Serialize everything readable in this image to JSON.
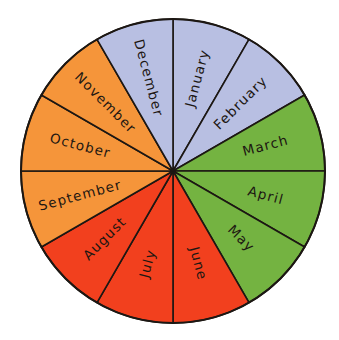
{
  "diagram": {
    "center": [
      173,
      171
    ],
    "radius": 152,
    "label_radius": 96,
    "seasons": {
      "winter": {
        "color": "#b8bfe2"
      },
      "spring": {
        "color": "#74b341"
      },
      "summer": {
        "color": "#f2401e"
      },
      "autumn": {
        "color": "#f5953a"
      }
    },
    "months": [
      {
        "label": "January",
        "season": "winter",
        "start_deg": 0,
        "end_deg": 30
      },
      {
        "label": "February",
        "season": "winter",
        "start_deg": 30,
        "end_deg": 60
      },
      {
        "label": "March",
        "season": "spring",
        "start_deg": 60,
        "end_deg": 90
      },
      {
        "label": "April",
        "season": "spring",
        "start_deg": 90,
        "end_deg": 120
      },
      {
        "label": "May",
        "season": "spring",
        "start_deg": 120,
        "end_deg": 150
      },
      {
        "label": "June",
        "season": "summer",
        "start_deg": 150,
        "end_deg": 180
      },
      {
        "label": "July",
        "season": "summer",
        "start_deg": 180,
        "end_deg": 210
      },
      {
        "label": "August",
        "season": "summer",
        "start_deg": 210,
        "end_deg": 240
      },
      {
        "label": "September",
        "season": "autumn",
        "start_deg": 240,
        "end_deg": 270
      },
      {
        "label": "October",
        "season": "autumn",
        "start_deg": 270,
        "end_deg": 300
      },
      {
        "label": "November",
        "season": "autumn",
        "start_deg": 300,
        "end_deg": 330
      },
      {
        "label": "December",
        "season": "winter",
        "start_deg": 330,
        "end_deg": 360
      }
    ]
  }
}
